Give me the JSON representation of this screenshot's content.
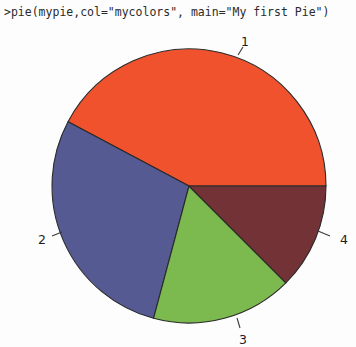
{
  "console": {
    "command": ">pie(mypie,col=\"mycolors\", main=\"My first Pie\")"
  },
  "plot": {
    "background_color": "#fdfdfd",
    "border_color": "#2a2a2a"
  },
  "chart_data": {
    "type": "pie",
    "title": "My first Pie",
    "xlabel": "",
    "ylabel": "",
    "categories": [
      "1",
      "2",
      "3",
      "4"
    ],
    "values": [
      42,
      29,
      17,
      12
    ],
    "labels": [
      "1",
      "2",
      "3",
      "4"
    ],
    "colors": [
      "#f0522d",
      "#555a93",
      "#7cb94e",
      "#733235"
    ],
    "legend": "none",
    "grid": false,
    "start_angle_deg": 0,
    "direction": "counterclockwise",
    "slices": [
      {
        "label": "1",
        "value": 42,
        "color": "#f0522d",
        "start_deg": 0,
        "end_deg": 152,
        "label_x": 245,
        "label_y": 42,
        "tick_x1": 238,
        "tick_y1": 55,
        "tick_x2": 243,
        "tick_y2": 47
      },
      {
        "label": "2",
        "value": 29,
        "color": "#555a93",
        "start_deg": 152,
        "end_deg": 255,
        "label_x": 42,
        "label_y": 240,
        "tick_x1": 62,
        "tick_y1": 232,
        "tick_x2": 52,
        "tick_y2": 236
      },
      {
        "label": "3",
        "value": 17,
        "color": "#7cb94e",
        "start_deg": 255,
        "end_deg": 315,
        "label_x": 243,
        "label_y": 340,
        "tick_x1": 237,
        "tick_y1": 318,
        "tick_x2": 240,
        "tick_y2": 328
      },
      {
        "label": "4",
        "value": 12,
        "color": "#733235",
        "start_deg": 315,
        "end_deg": 360,
        "label_x": 344,
        "label_y": 240,
        "tick_x1": 318,
        "tick_y1": 231,
        "tick_x2": 330,
        "tick_y2": 236
      }
    ],
    "geometry": {
      "center_x": 189,
      "center_y": 186,
      "radius": 137
    }
  }
}
